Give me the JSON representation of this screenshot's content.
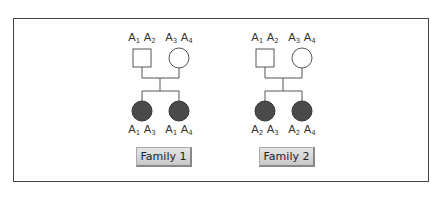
{
  "families": [
    {
      "button_label": "Family 1",
      "parents": [
        {
          "shape": "square",
          "genotype": [
            "A",
            "1",
            "A",
            "2"
          ]
        },
        {
          "shape": "circle",
          "genotype": [
            "A",
            "3",
            "A",
            "4"
          ]
        }
      ],
      "children": [
        {
          "shape": "circle-filled",
          "genotype": [
            "A",
            "1",
            "A",
            "3"
          ]
        },
        {
          "shape": "circle-filled",
          "genotype": [
            "A",
            "1",
            "A",
            "4"
          ]
        }
      ]
    },
    {
      "button_label": "Family 2",
      "parents": [
        {
          "shape": "square",
          "genotype": [
            "A",
            "1",
            "A",
            "2"
          ]
        },
        {
          "shape": "circle",
          "genotype": [
            "A",
            "3",
            "A",
            "4"
          ]
        }
      ],
      "children": [
        {
          "shape": "circle-filled",
          "genotype": [
            "A",
            "2",
            "A",
            "3"
          ]
        },
        {
          "shape": "circle-filled",
          "genotype": [
            "A",
            "2",
            "A",
            "4"
          ]
        }
      ]
    }
  ],
  "colors": {
    "affected_fill": "#4a4a4a",
    "line": "#555555"
  }
}
